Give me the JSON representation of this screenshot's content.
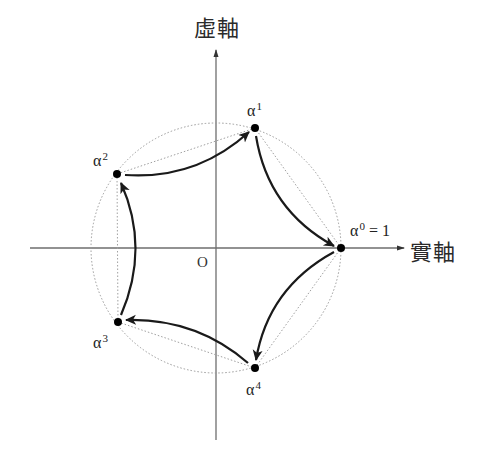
{
  "diagram": {
    "axes": {
      "real_label": "實軸",
      "imag_label": "虛軸",
      "origin_label": "O"
    },
    "center": {
      "x": 216,
      "y": 248
    },
    "radius": 125,
    "points": [
      {
        "id": "alpha0",
        "base": "α",
        "exp": "0",
        "suffix": " = 1",
        "x": 341,
        "y": 248
      },
      {
        "id": "alpha1",
        "base": "α",
        "exp": "1",
        "suffix": "",
        "x": 255,
        "y": 128
      },
      {
        "id": "alpha2",
        "base": "α",
        "exp": "2",
        "suffix": "",
        "x": 117,
        "y": 174
      },
      {
        "id": "alpha3",
        "base": "α",
        "exp": "3",
        "suffix": "",
        "x": 118,
        "y": 322
      },
      {
        "id": "alpha4",
        "base": "α",
        "exp": "4",
        "suffix": "",
        "x": 255,
        "y": 368
      }
    ],
    "arrow_direction": "clockwise: α² → α¹ → α⁰ → α⁴ → α³ → α²",
    "colors": {
      "axis": "#6e6e6e",
      "circle": "#9a9a9a",
      "chord": "#a0a0a0",
      "arrow": "#1a1a1a",
      "point": "#000000",
      "text": "#222222"
    }
  }
}
